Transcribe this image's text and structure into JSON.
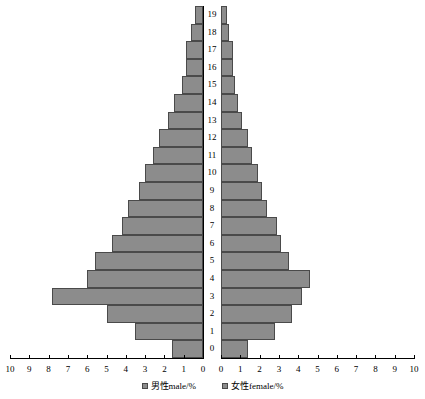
{
  "chart_data": {
    "type": "bar",
    "title": "",
    "subtitle": "",
    "orientation": "horizontal",
    "layout": "population-pyramid",
    "xlabel": "",
    "ylabel": "",
    "categories": [
      "0",
      "1",
      "2",
      "3",
      "4",
      "5",
      "6",
      "7",
      "8",
      "9",
      "10",
      "11",
      "12",
      "13",
      "14",
      "15",
      "16",
      "17",
      "18",
      "19"
    ],
    "series": [
      {
        "name": "男性male/%",
        "side": "left",
        "axis_direction": "right-to-left",
        "xlim": [
          0,
          10
        ],
        "values": [
          1.6,
          3.5,
          5.0,
          7.8,
          6.0,
          5.6,
          4.7,
          4.2,
          3.9,
          3.3,
          3.0,
          2.6,
          2.3,
          1.8,
          1.5,
          1.1,
          0.9,
          0.9,
          0.6,
          0.4
        ]
      },
      {
        "name": "女性female/%",
        "side": "right",
        "axis_direction": "left-to-right",
        "xlim": [
          0,
          10
        ],
        "values": [
          1.4,
          2.8,
          3.7,
          4.2,
          4.6,
          3.5,
          3.1,
          2.9,
          2.4,
          2.1,
          1.9,
          1.6,
          1.4,
          1.1,
          0.9,
          0.7,
          0.6,
          0.6,
          0.4,
          0.3
        ]
      }
    ],
    "x_ticks_left": [
      "10",
      "9",
      "8",
      "7",
      "6",
      "5",
      "4",
      "3",
      "2",
      "1",
      "0"
    ],
    "x_ticks_right": [
      "0",
      "1",
      "2",
      "3",
      "4",
      "5",
      "6",
      "7",
      "8",
      "9",
      "10"
    ],
    "y_ticks": [
      "19",
      "18",
      "17",
      "16",
      "15",
      "14",
      "13",
      "12",
      "11",
      "10",
      "9",
      "8",
      "7",
      "6",
      "5",
      "4",
      "3",
      "2",
      "1",
      "0"
    ],
    "grid": false,
    "legend_position": "bottom",
    "legend": [
      {
        "label": "男性male/%",
        "color": "#8c8c8c"
      },
      {
        "label": "女性female/%",
        "color": "#8c8c8c"
      }
    ],
    "colors": {
      "bar_fill": "#8c8c8c",
      "bar_border": "#4a4a4a",
      "axis": "#000000",
      "background": "#ffffff"
    }
  }
}
